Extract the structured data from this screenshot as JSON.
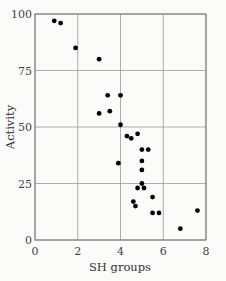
{
  "chart_data": {
    "type": "scatter",
    "title": "",
    "xlabel": "SH groups",
    "ylabel": "Activity",
    "xlim": [
      0,
      8
    ],
    "ylim": [
      0,
      100
    ],
    "xticks": [
      0,
      2,
      4,
      6,
      8
    ],
    "yticks": [
      0,
      25,
      50,
      75,
      100
    ],
    "grid": true,
    "legend": null,
    "points": [
      {
        "x": 0.9,
        "y": 97
      },
      {
        "x": 1.2,
        "y": 96
      },
      {
        "x": 1.9,
        "y": 85
      },
      {
        "x": 3.0,
        "y": 80
      },
      {
        "x": 3.4,
        "y": 64
      },
      {
        "x": 4.0,
        "y": 64
      },
      {
        "x": 3.0,
        "y": 56
      },
      {
        "x": 3.5,
        "y": 57
      },
      {
        "x": 4.0,
        "y": 51
      },
      {
        "x": 4.3,
        "y": 46
      },
      {
        "x": 4.5,
        "y": 45
      },
      {
        "x": 4.8,
        "y": 47
      },
      {
        "x": 5.0,
        "y": 40
      },
      {
        "x": 5.3,
        "y": 40
      },
      {
        "x": 3.9,
        "y": 34
      },
      {
        "x": 5.0,
        "y": 35
      },
      {
        "x": 5.0,
        "y": 31
      },
      {
        "x": 5.0,
        "y": 25
      },
      {
        "x": 4.8,
        "y": 23
      },
      {
        "x": 5.1,
        "y": 23
      },
      {
        "x": 4.6,
        "y": 17
      },
      {
        "x": 4.7,
        "y": 15
      },
      {
        "x": 5.5,
        "y": 19
      },
      {
        "x": 5.5,
        "y": 12
      },
      {
        "x": 5.8,
        "y": 12
      },
      {
        "x": 7.6,
        "y": 13
      },
      {
        "x": 6.8,
        "y": 5
      }
    ]
  },
  "labels": {
    "x": "SH groups",
    "y": "Activity"
  }
}
